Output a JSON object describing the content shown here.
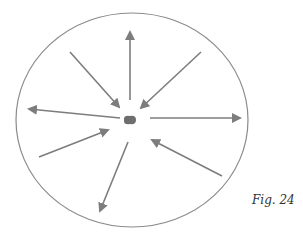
{
  "figure": {
    "caption": "Fig. 24",
    "stroke_color": "#7d7d7d",
    "boundary": {
      "cx": 132,
      "cy": 120,
      "rx": 116,
      "ry": 107
    },
    "center_particle": {
      "cx": 130,
      "cy": 120
    },
    "arrows": [
      {
        "name": "arrow-up-outward",
        "direction": "outward",
        "x1": 130,
        "y1": 100,
        "x2": 130,
        "y2": 32
      },
      {
        "name": "arrow-upper-left-inward",
        "direction": "inward",
        "x1": 70,
        "y1": 52,
        "x2": 119,
        "y2": 107
      },
      {
        "name": "arrow-upper-right-inward",
        "direction": "inward",
        "x1": 201,
        "y1": 52,
        "x2": 141,
        "y2": 108
      },
      {
        "name": "arrow-left-outward",
        "direction": "outward",
        "x1": 120,
        "y1": 118,
        "x2": 29,
        "y2": 109
      },
      {
        "name": "arrow-right-outward",
        "direction": "outward",
        "x1": 150,
        "y1": 118,
        "x2": 240,
        "y2": 118
      },
      {
        "name": "arrow-lower-left-inward",
        "direction": "inward",
        "x1": 39,
        "y1": 157,
        "x2": 108,
        "y2": 130
      },
      {
        "name": "arrow-down-outward",
        "direction": "outward",
        "x1": 128,
        "y1": 142,
        "x2": 100,
        "y2": 211
      },
      {
        "name": "arrow-lower-right-inward",
        "direction": "inward",
        "x1": 222,
        "y1": 176,
        "x2": 152,
        "y2": 140
      }
    ]
  }
}
